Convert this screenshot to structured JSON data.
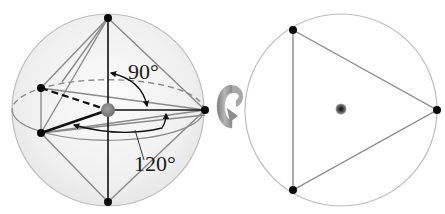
{
  "figure": {
    "type": "trigonal-bipyramidal-geometry",
    "left_view": {
      "angle_axial_label": "90°",
      "angle_equatorial_label": "120°"
    },
    "rotation_indicator": "rotate-icon",
    "right_view": {
      "description": "top-down view along axial axis showing equilateral triangle of equatorial positions"
    }
  },
  "colors": {
    "sphere_fill": "#f1f1f1",
    "sphere_stroke": "#b8b8b8",
    "edge_gray": "#8a8a8a",
    "bond_black": "#111111",
    "atom_black": "#0a0a0a",
    "central_atom": "#8c8c8c",
    "arrow_gray": "#9a9a9a"
  }
}
